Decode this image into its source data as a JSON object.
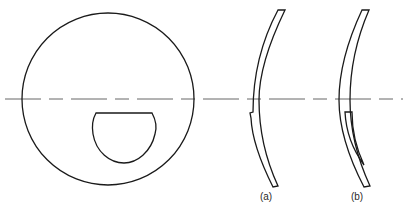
{
  "figure": {
    "type": "lens-diagram",
    "colors": {
      "line": "#1a1a1a",
      "axis": "#555555",
      "background": "#ffffff"
    },
    "front_view": {
      "outer_circle": {
        "cx": 108,
        "cy": 99,
        "r": 86
      },
      "segment": {
        "shape": "D-segment",
        "flat_top_y": 113,
        "left_x": 96,
        "right_x": 152,
        "bottom_y": 163
      }
    },
    "optical_axis": {
      "y": 99,
      "x_start": 5,
      "x_end": 403,
      "style": "dash-dot"
    },
    "sections": [
      {
        "id": "a",
        "label": "(a)",
        "label_x": 266,
        "label_y": 200
      },
      {
        "id": "b",
        "label": "(b)",
        "label_x": 357,
        "label_y": 200
      }
    ]
  }
}
